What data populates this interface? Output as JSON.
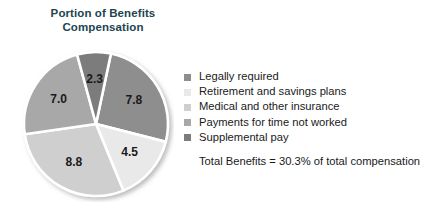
{
  "chart_data": {
    "type": "pie",
    "title": "Portion of Benefits Compensation",
    "title_lines": [
      "Portion of Benefits",
      "Compensation"
    ],
    "categories": [
      "Legally required",
      "Retirement and savings plans",
      "Medical and other insurance",
      "Payments for time not worked",
      "Supplemental pay"
    ],
    "values": [
      7.8,
      4.5,
      8.8,
      7.0,
      2.3
    ],
    "value_labels": [
      "7.8",
      "4.5",
      "8.8",
      "7.0",
      "2.3"
    ],
    "colors": [
      "#8e8e8e",
      "#e9e9e9",
      "#cfcfcf",
      "#a8a8a8",
      "#7c7c7c"
    ],
    "slice_label_positions": [
      {
        "x": 96,
        "y": 79
      },
      {
        "x": 142,
        "y": 122
      },
      {
        "x": 97,
        "y": 169
      },
      {
        "x": 47,
        "y": 131
      },
      {
        "x": 57,
        "y": 86
      }
    ],
    "units": "percent of total compensation",
    "annotation": "Total Benefits = 30.3% of total compensation",
    "legend_position": "right",
    "grid": false,
    "xlabel": "",
    "ylabel": ""
  },
  "legend": {
    "items": [
      {
        "label": "Legally required",
        "color": "#8e8e8e"
      },
      {
        "label": "Retirement and savings plans",
        "color": "#e9e9e9"
      },
      {
        "label": "Medical and other insurance",
        "color": "#cfcfcf"
      },
      {
        "label": "Payments for time not worked",
        "color": "#a8a8a8"
      },
      {
        "label": "Supplemental pay",
        "color": "#7c7c7c"
      }
    ]
  },
  "footnote": {
    "text": "Total Benefits = 30.3% of total compensation"
  }
}
